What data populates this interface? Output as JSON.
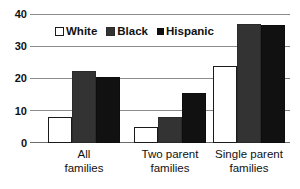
{
  "chart_data": {
    "type": "bar",
    "title": "",
    "xlabel": "",
    "ylabel": "",
    "ylim": [
      0,
      40
    ],
    "yticks": [
      0,
      10,
      20,
      30,
      40
    ],
    "ytick_labels": [
      "0",
      "10",
      "20",
      "30",
      "40"
    ],
    "grid": true,
    "legend_position": "upper-left-inside",
    "categories": [
      "All families",
      "Two parent families",
      "Single parent families"
    ],
    "category_lines": [
      [
        "All",
        "families"
      ],
      [
        "Two parent",
        "families"
      ],
      [
        "Single parent",
        "families"
      ]
    ],
    "series": [
      {
        "name": "White",
        "color": "#ffffff",
        "values": [
          8.2,
          5.0,
          24.0
        ]
      },
      {
        "name": "Black",
        "color": "#333333",
        "values": [
          22.4,
          8.0,
          37.2
        ]
      },
      {
        "name": "Hispanic",
        "color": "#111111",
        "values": [
          20.6,
          15.7,
          37.0
        ]
      }
    ]
  },
  "legend": {
    "items": [
      {
        "label": "White",
        "swatch": "white-square-icon"
      },
      {
        "label": "Black",
        "swatch": "dark-gray-square-icon"
      },
      {
        "label": "Hispanic",
        "swatch": "black-square-icon"
      }
    ]
  }
}
